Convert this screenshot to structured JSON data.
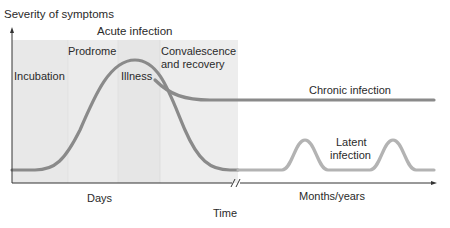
{
  "diagram": {
    "y_axis_label": "Severity of symptoms",
    "x_axis_label": "Time",
    "header": "Acute infection",
    "phases": [
      {
        "label": "Incubation"
      },
      {
        "label": "Prodrome"
      },
      {
        "label": "Illness"
      },
      {
        "label": "Convalescence",
        "label2": "and recovery"
      }
    ],
    "curves": [
      {
        "label": "Chronic infection"
      },
      {
        "label": "Latent",
        "label2": "infection"
      }
    ],
    "x_segments": [
      "Days",
      "Months/years"
    ],
    "colors": {
      "curve": "#8a8a8a",
      "latent_curve": "#b0b0b0",
      "shade_light": "#e6e6e6",
      "shade_mid": "#ececec",
      "axis": "#333333"
    }
  }
}
